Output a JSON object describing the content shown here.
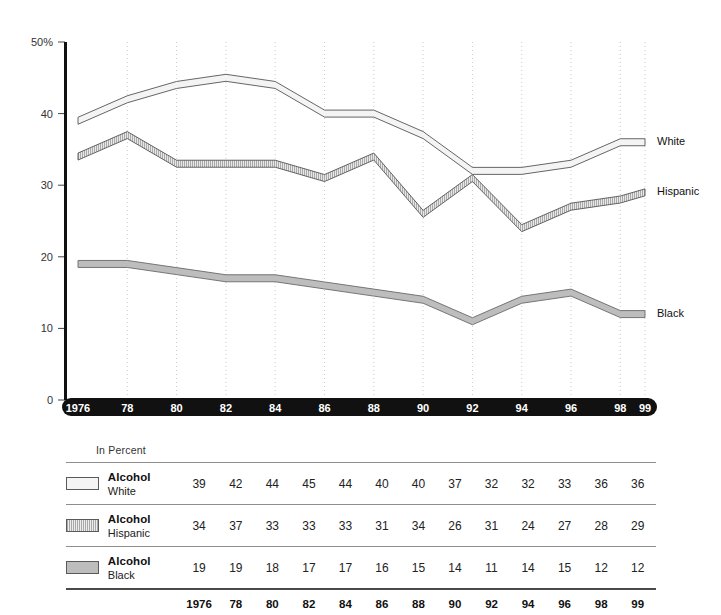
{
  "chart_data": {
    "type": "line",
    "title": "",
    "subtitle": "",
    "xlabel": "",
    "ylabel": "",
    "units_note": "In Percent",
    "x": [
      "1976",
      "78",
      "80",
      "82",
      "84",
      "86",
      "88",
      "90",
      "92",
      "94",
      "96",
      "98",
      "99"
    ],
    "categories": [
      "1976",
      "78",
      "80",
      "82",
      "84",
      "86",
      "88",
      "90",
      "92",
      "94",
      "96",
      "98",
      "99"
    ],
    "xlim": [
      1976,
      1999
    ],
    "ylim": [
      0,
      50
    ],
    "y_ticks": [
      "0",
      "10",
      "20",
      "30",
      "40",
      "50%"
    ],
    "y_tick_values": [
      0,
      10,
      20,
      30,
      40,
      50
    ],
    "grid": "vertical-dotted",
    "legend_position": "right-inline",
    "series": [
      {
        "name": "Alcohol",
        "subname": "White",
        "label": "White",
        "values": [
          39,
          42,
          44,
          45,
          44,
          40,
          40,
          37,
          32,
          32,
          33,
          36,
          36
        ],
        "fill": "#f4f4f4",
        "stroke": "#555555",
        "pattern": "solid-light"
      },
      {
        "name": "Alcohol",
        "subname": "Hispanic",
        "label": "Hispanic",
        "values": [
          34,
          37,
          33,
          33,
          33,
          31,
          34,
          26,
          31,
          24,
          27,
          28,
          29
        ],
        "fill": "#c9c9c9",
        "stroke": "#555555",
        "pattern": "hatched"
      },
      {
        "name": "Alcohol",
        "subname": "Black",
        "label": "Black",
        "values": [
          19,
          19,
          18,
          17,
          17,
          16,
          15,
          14,
          11,
          14,
          15,
          12,
          12
        ],
        "fill": "#bdbdbd",
        "stroke": "#6a6a6a",
        "pattern": "solid-gray"
      }
    ]
  },
  "axis": {
    "y_labels": [
      "50%",
      "40",
      "30",
      "20",
      "10",
      "0"
    ],
    "x_labels": [
      "1976",
      "78",
      "80",
      "82",
      "84",
      "86",
      "88",
      "90",
      "92",
      "94",
      "96",
      "98",
      "99"
    ],
    "x_axis_bar_color": "#111111",
    "x_axis_text_color": "#ffffff"
  },
  "series_labels": {
    "white": "White",
    "hispanic": "Hispanic",
    "black": "Black"
  },
  "table": {
    "units_label": "In Percent",
    "year_header": [
      "1976",
      "78",
      "80",
      "82",
      "84",
      "86",
      "88",
      "90",
      "92",
      "94",
      "96",
      "98",
      "99"
    ],
    "rows": [
      {
        "swatch": "white-sw",
        "name": "Alcohol",
        "subname": "White",
        "values": [
          "39",
          "42",
          "44",
          "45",
          "44",
          "40",
          "40",
          "37",
          "32",
          "32",
          "33",
          "36",
          "36"
        ]
      },
      {
        "swatch": "hisp-sw",
        "name": "Alcohol",
        "subname": "Hispanic",
        "values": [
          "34",
          "37",
          "33",
          "33",
          "33",
          "31",
          "34",
          "26",
          "31",
          "24",
          "27",
          "28",
          "29"
        ]
      },
      {
        "swatch": "black-sw",
        "name": "Alcohol",
        "subname": "Black",
        "values": [
          "19",
          "19",
          "18",
          "17",
          "17",
          "16",
          "15",
          "14",
          "11",
          "14",
          "15",
          "12",
          "12"
        ]
      }
    ]
  },
  "colors": {
    "white_band": "#f4f4f4",
    "hispanic_band": "#c9c9c9",
    "black_band": "#bdbdbd",
    "axis": "#111111",
    "grid": "#cccccc"
  }
}
